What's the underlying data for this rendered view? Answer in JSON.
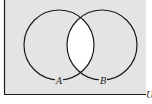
{
  "diagram": {
    "type": "venn",
    "universe_label": "U",
    "sets": [
      {
        "label": "A"
      },
      {
        "label": "B"
      }
    ],
    "shaded_region": "complement of A ∩ B",
    "unshaded_region": "A ∩ B",
    "colors": {
      "shade": "#e4e4e4",
      "unshaded": "#ffffff",
      "stroke": "#1a1a1a"
    }
  }
}
